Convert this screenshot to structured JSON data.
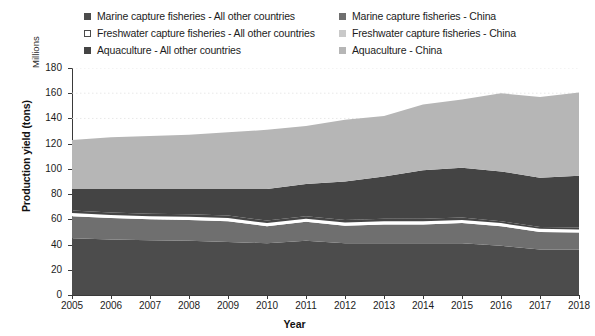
{
  "chart_data": {
    "type": "area",
    "title": "",
    "subtitle": "",
    "xlabel": "Year",
    "ylabel": "Production yield (tons)",
    "units_label": "Millions",
    "stacked": true,
    "grid": true,
    "legend_position": "top",
    "categories": [
      2005,
      2006,
      2007,
      2008,
      2009,
      2010,
      2011,
      2012,
      2013,
      2014,
      2015,
      2016,
      2017,
      2018
    ],
    "x": [
      "2005",
      "2006",
      "2007",
      "2008",
      "2009",
      "2010",
      "2011",
      "2012",
      "2013",
      "2014",
      "2015",
      "2016",
      "2017",
      "2018"
    ],
    "xlim": [
      2005,
      2018
    ],
    "ylim": [
      0,
      180
    ],
    "yticks": [
      0,
      20,
      40,
      60,
      80,
      100,
      120,
      140,
      160,
      180
    ],
    "series": [
      {
        "name": "Marine capture fisheries - All other countries",
        "color": "#4c4c4c",
        "values": [
          45.0,
          44.0,
          43.5,
          43.0,
          42.0,
          41.0,
          43.0,
          41.0,
          41.0,
          41.0,
          41.0,
          39.0,
          36.0,
          36.0
        ]
      },
      {
        "name": "Marine capture fisheries - China",
        "color": "#6f6f6f",
        "values": [
          17.5,
          17.0,
          16.5,
          16.5,
          16.5,
          13.5,
          15.0,
          14.0,
          15.0,
          15.0,
          16.0,
          15.5,
          14.0,
          13.5
        ]
      },
      {
        "name": "Freshwater capture fisheries - All other countries",
        "color": "#ffffff",
        "values": [
          2.5,
          2.5,
          2.5,
          2.5,
          2.5,
          2.5,
          2.5,
          2.5,
          2.5,
          2.5,
          2.5,
          2.5,
          2.5,
          2.5
        ]
      },
      {
        "name": "Freshwater capture fisheries - China",
        "color": "#454545",
        "values": [
          2.0,
          2.0,
          2.0,
          2.0,
          2.0,
          2.0,
          2.0,
          2.0,
          2.0,
          2.0,
          2.0,
          1.5,
          1.5,
          1.5
        ]
      },
      {
        "name": "Aquaculture - All other countries",
        "color": "#444444",
        "values": [
          17.0,
          18.5,
          19.5,
          20.0,
          21.0,
          25.0,
          25.5,
          30.5,
          33.5,
          38.5,
          39.5,
          39.5,
          39.0,
          41.0
        ]
      },
      {
        "name": "Aquaculture - China",
        "color": "#b6b6b6",
        "values": [
          39.0,
          41.0,
          42.0,
          43.0,
          45.0,
          47.0,
          46.0,
          49.0,
          48.0,
          52.0,
          54.0,
          62.0,
          64.0,
          66.0
        ]
      }
    ],
    "totals": [
      123.0,
      125.0,
      126.0,
      127.0,
      129.0,
      131.0,
      134.0,
      139.0,
      142.0,
      149.0,
      155.0,
      160.0,
      157.0,
      160.5
    ],
    "legend_entries": [
      {
        "label": "Marine capture fisheries - All other countries",
        "color": "#4c4c4c",
        "outlined": false
      },
      {
        "label": "Marine capture fisheries - China",
        "color": "#6f6f6f",
        "outlined": false
      },
      {
        "label": "Freshwater capture fisheries - All other countries",
        "color": "#ffffff",
        "outlined": true
      },
      {
        "label": "Freshwater capture fisheries - China",
        "color": "#c9c9c9",
        "outlined": false
      },
      {
        "label": "Aquaculture - All other countries",
        "color": "#444444",
        "outlined": false
      },
      {
        "label": "Aquaculture - China",
        "color": "#b6b6b6",
        "outlined": false
      }
    ]
  }
}
